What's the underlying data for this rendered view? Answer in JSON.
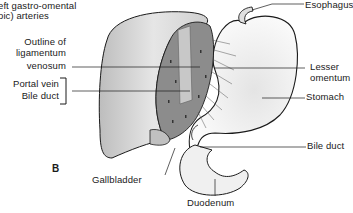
{
  "figure": {
    "panel_letter": "B",
    "labels": {
      "top_left_line1": "eft gastro-omental",
      "top_left_line2": "oic) arteries",
      "ligamentum_line1": "Outline of",
      "ligamentum_line2": "ligamentum",
      "ligamentum_line3": "venosum",
      "portal_vein": "Portal vein",
      "bile_duct_left": "Bile duct",
      "gallbladder": "Gallbladder",
      "duodenum": "Duodenum",
      "esophagus": "Esophagus",
      "lesser_omentum_line1": "Lesser",
      "lesser_omentum_line2": "omentum",
      "stomach": "Stomach",
      "bile_duct_right": "Bile duct"
    },
    "colors": {
      "ink": "#1a1a1a",
      "liver_fill": "#d9d9d9",
      "cut_surface": "#8c8c8c",
      "stomach_fill": "#f2f2f2"
    }
  }
}
